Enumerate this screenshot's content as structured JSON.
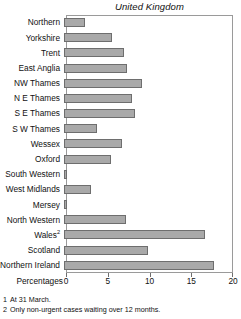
{
  "chart_data": {
    "type": "bar",
    "orientation": "horizontal",
    "title": "United Kingdom",
    "xlabel": "Percentages",
    "ylabel": "",
    "xlim": [
      0,
      20
    ],
    "xticks": [
      0,
      5,
      10,
      15,
      20
    ],
    "xticklabels": [
      "0",
      "5",
      "10",
      "15",
      "20"
    ],
    "grid": false,
    "legend": null,
    "bar_color": "#a9a9a9",
    "bar_edge_color": "#6e6e6e",
    "categories": [
      "Northern",
      "Yorkshire",
      "Trent",
      "East Anglia",
      "NW Thames",
      "N E Thames",
      "S E Thames",
      "S W Thames",
      "Wessex",
      "Oxford",
      "South Western",
      "West Midlands",
      "Mersey",
      "North Western",
      "Wales",
      "Scotland",
      "Northern Ireland"
    ],
    "category_superscripts": {
      "Wales": "2"
    },
    "values": [
      2.5,
      5.8,
      7.2,
      7.5,
      9.4,
      8.1,
      8.5,
      4.0,
      7.0,
      5.6,
      0.4,
      3.2,
      0.4,
      7.4,
      16.9,
      10.0,
      18.0
    ]
  },
  "footnotes": [
    {
      "num": "1",
      "text": "At 31 March."
    },
    {
      "num": "2",
      "text": "Only non-urgent cases waiting over 12 months."
    }
  ]
}
